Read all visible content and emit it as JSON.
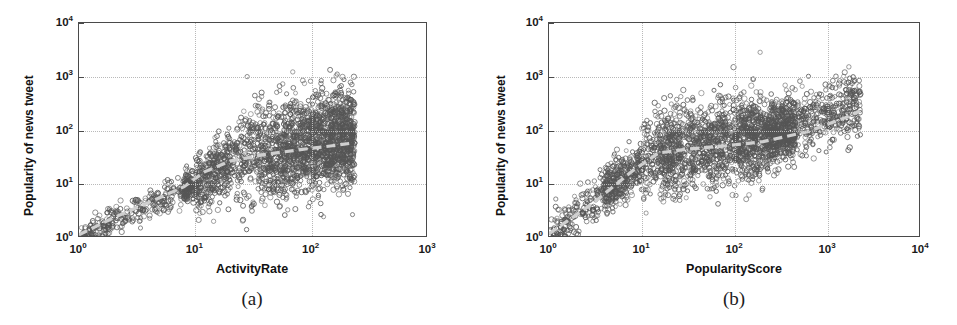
{
  "figure": {
    "caption_a": "(a)",
    "caption_b": "(b)"
  },
  "chart_data": [
    {
      "type": "scatter",
      "panel": "a",
      "title": "",
      "xlabel": "ActivityRate",
      "ylabel": "Popularity of news tweet",
      "xscale": "log",
      "yscale": "log",
      "xlim": [
        1,
        1000
      ],
      "ylim": [
        1,
        10000
      ],
      "xticks": [
        1,
        10,
        100,
        1000
      ],
      "xticklabels": [
        "10⁰",
        "10¹",
        "10²",
        "10³"
      ],
      "yticks": [
        1,
        10,
        100,
        1000,
        10000
      ],
      "yticklabels": [
        "10⁰",
        "10¹",
        "10²",
        "10³",
        "10⁴"
      ],
      "grid": true,
      "legend": "none",
      "marker": "open-circle",
      "marker_color": "#555555",
      "n_points": 2600,
      "trendline": {
        "style": "dashed",
        "color": "#cfcfcf",
        "points": [
          [
            1,
            1.15
          ],
          [
            2,
            2.4
          ],
          [
            4,
            4.6
          ],
          [
            8,
            9.0
          ],
          [
            12,
            17
          ],
          [
            20,
            27
          ],
          [
            40,
            36
          ],
          [
            80,
            44
          ],
          [
            150,
            52
          ],
          [
            220,
            58
          ]
        ]
      },
      "cloud": {
        "description": "Dense elongated cloud rising from lower-left along a power law, widening into a dark blob between x=20 and x=200 centered near y=100-300, with a sharp right cutoff near x=230",
        "core_x_range": [
          15,
          230
        ],
        "core_y_range": [
          20,
          600
        ]
      }
    },
    {
      "type": "scatter",
      "panel": "b",
      "title": "",
      "xlabel": "PopularityScore",
      "ylabel": "Popularity of news tweet",
      "xscale": "log",
      "yscale": "log",
      "xlim": [
        1,
        10000
      ],
      "ylim": [
        1,
        10000
      ],
      "xticks": [
        1,
        10,
        100,
        1000,
        10000
      ],
      "xticklabels": [
        "10⁰",
        "10¹",
        "10²",
        "10³",
        "10⁴"
      ],
      "yticks": [
        1,
        10,
        100,
        1000,
        10000
      ],
      "yticklabels": [
        "10⁰",
        "10¹",
        "10²",
        "10³",
        "10⁴"
      ],
      "grid": true,
      "legend": "none",
      "marker": "open-circle",
      "marker_color": "#555555",
      "n_points": 2800,
      "trendline": {
        "style": "dashed",
        "color": "#cfcfcf",
        "points": [
          [
            1,
            1.2
          ],
          [
            3,
            4.5
          ],
          [
            8,
            18
          ],
          [
            15,
            38
          ],
          [
            30,
            45
          ],
          [
            80,
            52
          ],
          [
            200,
            62
          ],
          [
            600,
            95
          ],
          [
            1500,
            170
          ],
          [
            2200,
            230
          ]
        ]
      },
      "cloud": {
        "description": "Broad dense cloud rising steeply from x=1 to x=20 then flattening into a wide dark band from x=20 to x=1000 centered near y=150, tapering to a diagonal tail toward x=2000",
        "core_x_range": [
          3,
          2000
        ],
        "core_y_range": [
          10,
          900
        ]
      }
    }
  ]
}
